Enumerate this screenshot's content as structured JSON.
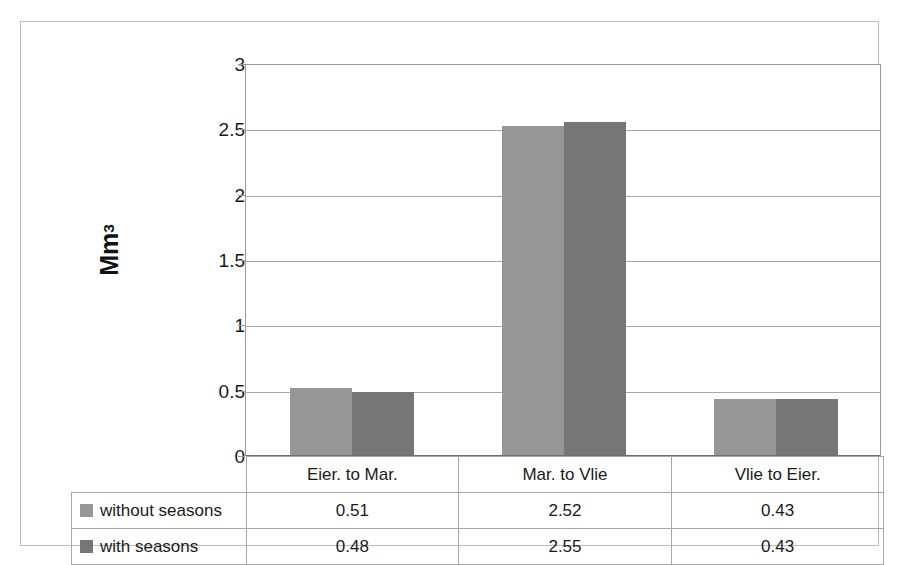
{
  "chart_data": {
    "type": "bar",
    "title": "",
    "xlabel": "",
    "ylabel": "Mm3",
    "ylabel_base": "Mm",
    "ylabel_sup": "3",
    "categories": [
      "Eier. to Mar.",
      "Mar. to Vlie",
      "Vlie to Eier."
    ],
    "series": [
      {
        "name": "without seasons",
        "color": "#969696",
        "values": [
          0.51,
          2.52,
          0.43
        ]
      },
      {
        "name": "with seasons",
        "color": "#767676",
        "values": [
          0.48,
          2.55,
          0.43
        ]
      }
    ],
    "ylim": [
      0,
      3
    ],
    "ytick_labels": [
      "0",
      "0.5",
      "1",
      "1.5",
      "2",
      "2.5",
      "3"
    ],
    "ytick_values": [
      0,
      0.5,
      1,
      1.5,
      2,
      2.5,
      3
    ],
    "grid": true,
    "legend_position": "data-table-below",
    "value_labels": {
      "without seasons": [
        "0.51",
        "2.52",
        "0.43"
      ],
      "with seasons": [
        "0.48",
        "2.55",
        "0.43"
      ]
    }
  },
  "table": {
    "header_row": [
      "",
      "Eier. to Mar.",
      "Mar. to Vlie",
      "Vlie to Eier."
    ],
    "rows": [
      {
        "label": "without seasons",
        "cells": [
          "0.51",
          "2.52",
          "0.43"
        ]
      },
      {
        "label": "with seasons",
        "cells": [
          "0.48",
          "2.55",
          "0.43"
        ]
      }
    ]
  },
  "colors": {
    "series_without_seasons": "#969696",
    "series_with_seasons": "#767676",
    "gridline": "#a8a8a8",
    "border": "#bdbdbd",
    "table_border": "#a9a9a9",
    "text": "#1a1a1a"
  }
}
